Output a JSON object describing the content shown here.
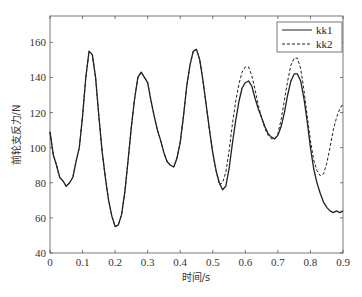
{
  "chart_data": {
    "type": "line",
    "title": "",
    "xlabel": "时间/s",
    "ylabel": "前轮支反力/N",
    "xlim": [
      0,
      0.9
    ],
    "ylim": [
      40,
      175
    ],
    "xticks": [
      0,
      0.1,
      0.2,
      0.3,
      0.4,
      0.5,
      0.6,
      0.7,
      0.8,
      0.9
    ],
    "xtick_labels": [
      "0",
      "0.1",
      "0.2",
      "0.3",
      "0.4",
      "0.5",
      "0.6",
      "0.7",
      "0.8",
      "0.9"
    ],
    "yticks": [
      40,
      60,
      80,
      100,
      120,
      140,
      160
    ],
    "ytick_labels": [
      "40",
      "60",
      "80",
      "100",
      "120",
      "140",
      "160"
    ],
    "grid": false,
    "legend_position": "upper right",
    "x": [
      0,
      0.01,
      0.02,
      0.03,
      0.04,
      0.05,
      0.06,
      0.07,
      0.08,
      0.09,
      0.1,
      0.11,
      0.12,
      0.13,
      0.14,
      0.15,
      0.16,
      0.17,
      0.18,
      0.19,
      0.2,
      0.21,
      0.22,
      0.23,
      0.24,
      0.25,
      0.26,
      0.27,
      0.28,
      0.29,
      0.3,
      0.31,
      0.32,
      0.33,
      0.34,
      0.35,
      0.36,
      0.37,
      0.38,
      0.39,
      0.4,
      0.41,
      0.42,
      0.43,
      0.44,
      0.45,
      0.46,
      0.47,
      0.48,
      0.49,
      0.5,
      0.51,
      0.52,
      0.53,
      0.54,
      0.55,
      0.56,
      0.57,
      0.58,
      0.59,
      0.6,
      0.61,
      0.62,
      0.63,
      0.64,
      0.65,
      0.66,
      0.67,
      0.68,
      0.69,
      0.7,
      0.71,
      0.72,
      0.73,
      0.74,
      0.75,
      0.76,
      0.77,
      0.78,
      0.79,
      0.8,
      0.81,
      0.82,
      0.83,
      0.84,
      0.85,
      0.86,
      0.87,
      0.88,
      0.89,
      0.9
    ],
    "series": [
      {
        "name": "kk1",
        "style": "solid",
        "color": "#222222",
        "values": [
          109,
          96,
          90,
          83,
          81,
          78,
          80,
          83,
          92,
          100,
          118,
          140,
          155,
          153,
          140,
          118,
          98,
          83,
          70,
          61,
          55,
          56,
          62,
          75,
          93,
          112,
          128,
          140,
          143,
          140,
          137,
          127,
          118,
          110,
          104,
          97,
          92,
          90,
          89,
          94,
          103,
          118,
          135,
          147,
          155,
          156,
          150,
          138,
          124,
          110,
          97,
          87,
          80,
          76,
          78,
          88,
          102,
          115,
          126,
          134,
          137,
          138,
          135,
          128,
          122,
          117,
          112,
          108,
          106,
          105,
          107,
          112,
          120,
          130,
          138,
          142,
          142,
          138,
          128,
          115,
          100,
          88,
          80,
          74,
          69,
          66,
          64,
          63,
          64,
          63,
          64
        ]
      },
      {
        "name": "kk2",
        "style": "dashed",
        "color": "#222222",
        "values": [
          109,
          96,
          90,
          83,
          81,
          78,
          80,
          83,
          92,
          100,
          118,
          140,
          155,
          153,
          140,
          118,
          98,
          83,
          70,
          61,
          55,
          56,
          62,
          75,
          93,
          112,
          128,
          140,
          143,
          140,
          137,
          127,
          118,
          110,
          104,
          97,
          92,
          90,
          89,
          94,
          103,
          118,
          135,
          147,
          155,
          156,
          150,
          138,
          124,
          110,
          97,
          87,
          79,
          80,
          86,
          98,
          113,
          126,
          136,
          143,
          146,
          146,
          141,
          133,
          124,
          117,
          111,
          107,
          105,
          105,
          108,
          116,
          127,
          138,
          147,
          151,
          151,
          145,
          133,
          118,
          104,
          93,
          87,
          84,
          85,
          91,
          100,
          110,
          117,
          122,
          125
        ]
      }
    ]
  },
  "legend": {
    "items": [
      {
        "label": "kk1",
        "style": "solid"
      },
      {
        "label": "kk2",
        "style": "dashed"
      }
    ]
  },
  "axes": {
    "xlabel": "时间/s",
    "ylabel": "前轮支反力/N"
  }
}
